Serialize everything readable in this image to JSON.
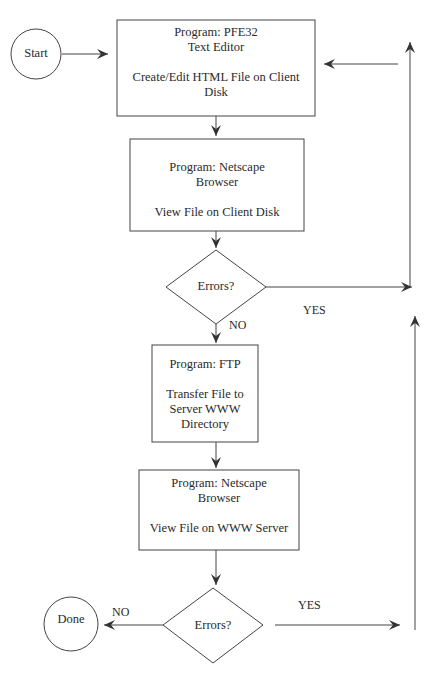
{
  "diagram": {
    "start": {
      "label": "Start"
    },
    "done": {
      "label": "Done"
    },
    "step1": {
      "line1": "Program: PFE32",
      "line2": "Text Editor",
      "line3": "Create/Edit HTML File on Client",
      "line4": "Disk"
    },
    "step2": {
      "line1": "Program: Netscape",
      "line2": "Browser",
      "line3": "View File on Client Disk"
    },
    "decision1": {
      "label": "Errors?",
      "yes": "YES",
      "no": "NO"
    },
    "step3": {
      "line1": "Program: FTP",
      "line2": "Transfer File to",
      "line3": "Server WWW",
      "line4": "Directory"
    },
    "step4": {
      "line1": "Program: Netscape",
      "line2": "Browser",
      "line3": "View File on WWW Server"
    },
    "decision2": {
      "label": "Errors?",
      "yes": "YES",
      "no": "NO"
    }
  }
}
